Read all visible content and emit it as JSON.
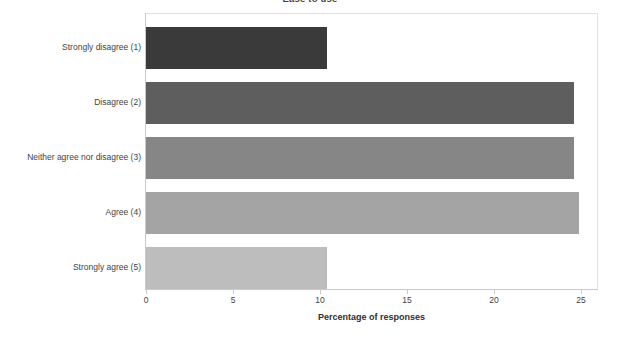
{
  "chart_data": {
    "type": "bar",
    "orientation": "horizontal",
    "title": "Ease to use",
    "xlabel": "Percentage of responses",
    "ylabel": "",
    "categories": [
      "Strongly disagree (1)",
      "Disagree (2)",
      "Neither agree nor disagree (3)",
      "Agree (4)",
      "Strongly agree (5)"
    ],
    "values": [
      10.4,
      24.6,
      24.6,
      24.9,
      10.4
    ],
    "bar_colors": [
      "#3a3a3a",
      "#5e5e5e",
      "#868686",
      "#a4a4a4",
      "#bdbdbd"
    ],
    "xlim": [
      0,
      26
    ],
    "xticks": [
      0,
      5,
      10,
      15,
      20,
      25
    ],
    "xtick_labels": [
      "0",
      "5",
      "10",
      "15",
      "20",
      "25"
    ],
    "grid": false,
    "legend": false
  }
}
